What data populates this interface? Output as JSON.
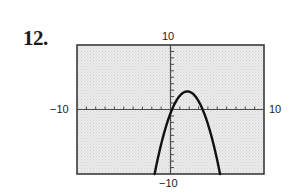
{
  "problem": {
    "number": "12."
  },
  "chart_data": {
    "type": "line",
    "title": "",
    "xlabel": "",
    "ylabel": "",
    "xlim": [
      -10,
      10
    ],
    "ylim": [
      -10,
      10
    ],
    "x_tick_step": 1,
    "y_tick_step": 1,
    "grid": false,
    "legend": null,
    "tick_labels": {
      "xmin": "−10",
      "xmax": "10",
      "ymin": "−10",
      "ymax": "10"
    },
    "series": [
      {
        "name": "parabola",
        "description": "downward-opening parabola, vertex approx (1.8, 2.8)",
        "vertex": [
          1.8,
          2.8
        ],
        "x_intercepts": [
          0.16,
          3.44
        ],
        "points": [
          [
            -1.7,
            -10.0
          ],
          [
            -1.2,
            -6.6
          ],
          [
            -0.7,
            -3.7
          ],
          [
            -0.2,
            -1.2
          ],
          [
            0.2,
            0.1
          ],
          [
            0.6,
            1.3
          ],
          [
            1.0,
            2.1
          ],
          [
            1.4,
            2.6
          ],
          [
            1.8,
            2.8
          ],
          [
            2.2,
            2.6
          ],
          [
            2.6,
            2.1
          ],
          [
            3.0,
            1.3
          ],
          [
            3.4,
            0.1
          ],
          [
            3.8,
            -1.4
          ],
          [
            4.3,
            -3.7
          ],
          [
            4.8,
            -6.6
          ],
          [
            5.3,
            -10.0
          ]
        ]
      }
    ]
  },
  "colors": {
    "frame": "#3a3a3a",
    "background": "#e6e6e6",
    "curve": "#111111",
    "axis": "#4a4a4a"
  }
}
